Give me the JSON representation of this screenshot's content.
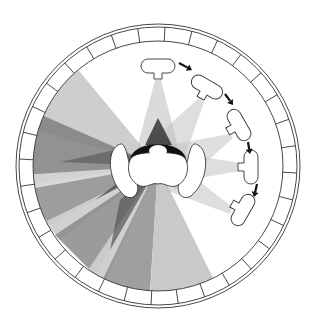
{
  "diagram": {
    "title": "Overhead lighting diagram: subject at center of circular studio with moving light",
    "center": [
      158,
      166
    ],
    "outer_ring": {
      "r_outer": 142,
      "r_outer2": 139,
      "r_inner": 125,
      "segments": 32,
      "stroke": "#333333"
    },
    "colors": {
      "background": "#ffffff",
      "light_1": "#d4d4d4",
      "light_2": "#bdbdbd",
      "light_3": "#9a9a9a",
      "light_4": "#7e7e7e",
      "dark": "#3a3a3a",
      "black": "#111111",
      "outline": "#333333"
    },
    "lamps": [
      {
        "label": "light position 1",
        "x": 158,
        "y": 66,
        "rotate": 0
      },
      {
        "label": "light position 2",
        "x": 207,
        "y": 87,
        "rotate": 30
      },
      {
        "label": "light position 3",
        "x": 239,
        "y": 125,
        "rotate": 60
      },
      {
        "label": "light position 4",
        "x": 251,
        "y": 167,
        "rotate": 90
      },
      {
        "label": "light position 5",
        "x": 243,
        "y": 210,
        "rotate": 120
      }
    ],
    "arrows": [
      {
        "from": [
          179,
          63
        ],
        "to": [
          192,
          70
        ]
      },
      {
        "from": [
          225,
          94
        ],
        "to": [
          233,
          105
        ]
      },
      {
        "from": [
          248,
          142
        ],
        "to": [
          250,
          154
        ]
      },
      {
        "from": [
          257,
          184
        ],
        "to": [
          254,
          197
        ]
      }
    ],
    "subject": {
      "label": "subject seen from above with arms raised",
      "x": 158,
      "y": 166
    },
    "caption": "Light moves around the subject in steps, indicated by arrows"
  }
}
